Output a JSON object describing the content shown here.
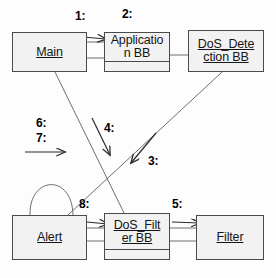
{
  "diagram": {
    "type": "uml-collaboration-diagram",
    "line_color": "#4a4a4a",
    "text_color": "#151515",
    "background": "#fdfdfd",
    "objects": [
      {
        "id": "main",
        "name": "Main",
        "x": 12,
        "y": 32,
        "w": 75,
        "h": 40,
        "compartment": false
      },
      {
        "id": "application_bb",
        "name": "Applicatio\nn BB",
        "x": 104,
        "y": 32,
        "w": 66,
        "h": 40,
        "compartment": true
      },
      {
        "id": "dos_detection",
        "name": "DoS_Dete\nction BB",
        "x": 188,
        "y": 30,
        "w": 76,
        "h": 42,
        "compartment": false
      },
      {
        "id": "alert",
        "name": "Alert",
        "x": 12,
        "y": 215,
        "w": 75,
        "h": 45,
        "compartment": false
      },
      {
        "id": "dos_filter_bb",
        "name": "DoS_Filt\ner BB",
        "x": 104,
        "y": 213,
        "w": 66,
        "h": 47,
        "compartment": true
      },
      {
        "id": "filter",
        "name": "Filter",
        "x": 196,
        "y": 215,
        "w": 68,
        "h": 45,
        "compartment": false
      }
    ],
    "messages": [
      {
        "id": "m1",
        "label": "1:",
        "x": 75,
        "y": 10,
        "from": "main",
        "to": "application_bb"
      },
      {
        "id": "m2",
        "label": "2:",
        "x": 122,
        "y": 8,
        "from": "application_bb",
        "to": "application_bb"
      },
      {
        "id": "m3",
        "label": "3:",
        "x": 148,
        "y": 155,
        "from": "dos_detection",
        "to": "alert"
      },
      {
        "id": "m4",
        "label": "4:",
        "x": 104,
        "y": 122,
        "from": "application_bb",
        "to": "dos_filter_bb"
      },
      {
        "id": "m5",
        "label": "5:",
        "x": 172,
        "y": 198,
        "from": "dos_filter_bb",
        "to": "filter"
      },
      {
        "id": "m6",
        "label": "6:",
        "x": 36,
        "y": 117,
        "from": "external",
        "to": "main"
      },
      {
        "id": "m7",
        "label": "7:",
        "x": 36,
        "y": 132,
        "from": "external",
        "to": "main"
      },
      {
        "id": "m8",
        "label": "8:",
        "x": 79,
        "y": 198,
        "from": "alert",
        "to": "dos_filter_bb"
      }
    ]
  }
}
